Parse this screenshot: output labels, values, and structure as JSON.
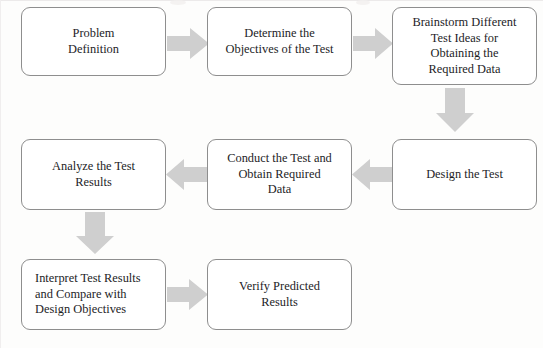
{
  "diagram": {
    "background_color": "#fdfdfc",
    "box_fill": "#ffffff",
    "box_border_color": "#8e8e8e",
    "arrow_color": "#cfcfcf",
    "text_color": "#1d1d1f",
    "nodes": [
      {
        "id": "problem-definition",
        "label": "Problem\nDefinition",
        "row": 1,
        "order": 1
      },
      {
        "id": "determine-objectives",
        "label": "Determine the\nObjectives of the Test",
        "row": 1,
        "order": 2
      },
      {
        "id": "brainstorm-test-ideas",
        "label": "Brainstorm Different\nTest Ideas for\nObtaining the\nRequired Data",
        "row": 1,
        "order": 3
      },
      {
        "id": "design-the-test",
        "label": "Design the Test",
        "row": 2,
        "order": 4
      },
      {
        "id": "conduct-the-test",
        "label": "Conduct the Test and\nObtain Required\nData",
        "row": 2,
        "order": 5
      },
      {
        "id": "analyze-test-results",
        "label": "Analyze the Test\nResults",
        "row": 2,
        "order": 6
      },
      {
        "id": "interpret-test-results",
        "label": "Interpret Test Results\nand Compare with\nDesign Objectives",
        "row": 3,
        "order": 7
      },
      {
        "id": "verify-predicted-results",
        "label": "Verify Predicted\nResults",
        "row": 3,
        "order": 8
      }
    ],
    "connectors": [
      {
        "id": "arrow-problem-to-objectives",
        "direction": "right",
        "from": "problem-definition",
        "to": "determine-objectives"
      },
      {
        "id": "arrow-objectives-to-brainstorm",
        "direction": "right",
        "from": "determine-objectives",
        "to": "brainstorm-test-ideas"
      },
      {
        "id": "arrow-brainstorm-to-design",
        "direction": "down",
        "from": "brainstorm-test-ideas",
        "to": "design-the-test"
      },
      {
        "id": "arrow-design-to-conduct",
        "direction": "left",
        "from": "design-the-test",
        "to": "conduct-the-test"
      },
      {
        "id": "arrow-conduct-to-analyze",
        "direction": "left",
        "from": "conduct-the-test",
        "to": "analyze-test-results"
      },
      {
        "id": "arrow-analyze-to-interpret",
        "direction": "down",
        "from": "analyze-test-results",
        "to": "interpret-test-results"
      },
      {
        "id": "arrow-interpret-to-verify",
        "direction": "right",
        "from": "interpret-test-results",
        "to": "verify-predicted-results"
      }
    ]
  }
}
